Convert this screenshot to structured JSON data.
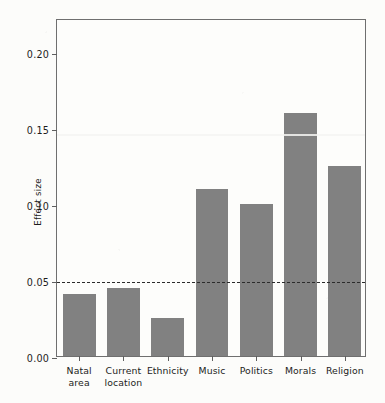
{
  "chart_data": {
    "type": "bar",
    "title": "",
    "subtitle": "",
    "xlabel": "",
    "ylabel": "Effect size",
    "categories": [
      "Natal area",
      "Current location",
      "Ethnicity",
      "Music",
      "Politics",
      "Morals",
      "Religion"
    ],
    "category_lines": [
      [
        "Natal",
        "area"
      ],
      [
        "Current",
        "location"
      ],
      [
        "Ethnicity"
      ],
      [
        "Music"
      ],
      [
        "Politics"
      ],
      [
        "Morals"
      ],
      [
        "Religion"
      ]
    ],
    "values": [
      0.041,
      0.045,
      0.025,
      0.11,
      0.1,
      0.16,
      0.125
    ],
    "ylim": [
      0.0,
      0.2223
    ],
    "yticks": [
      0.0,
      0.05,
      0.1,
      0.15,
      0.2
    ],
    "ytick_labels": [
      "0.00",
      "0.05",
      "0.10",
      "0.15",
      "0.20"
    ],
    "grid": false,
    "legend": null,
    "annotations": [
      {
        "name": "threshold-line",
        "kind": "horizontal-dashed-line",
        "value": 0.05
      }
    ],
    "colors": {
      "bar_fill": "#818181",
      "axis": "#6f6f6f",
      "text": "#1c1c1c",
      "background": "#fdfdfb",
      "threshold_line": "#2b2b2b"
    }
  }
}
